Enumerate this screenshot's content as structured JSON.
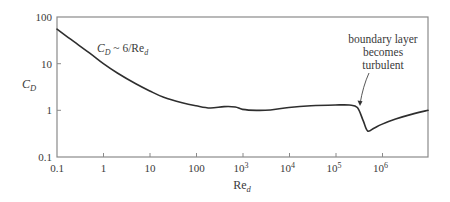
{
  "chart_data": {
    "type": "line",
    "title": "",
    "xlabel": "Re_d",
    "ylabel": "C_D",
    "xscale": "log",
    "yscale": "log",
    "xlim": [
      0.1,
      10000000
    ],
    "ylim": [
      0.1,
      100
    ],
    "grid": false,
    "legend": null,
    "x_tick_labels": [
      "0.1",
      "1",
      "10",
      "100",
      "10^3",
      "10^4",
      "10^5",
      "10^6"
    ],
    "x_tick_values": [
      0.1,
      1,
      10,
      100,
      1000,
      10000,
      100000,
      1000000
    ],
    "y_tick_labels": [
      "0.1",
      "1",
      "10",
      "100"
    ],
    "y_tick_values": [
      0.1,
      1,
      10,
      100
    ],
    "series": [
      {
        "name": "C_D vs Re_d (sphere drag)",
        "x": [
          0.1,
          0.2,
          0.5,
          1,
          2,
          5,
          10,
          20,
          50,
          100,
          200,
          400,
          700,
          1000,
          2000,
          4000,
          10000,
          30000,
          100000,
          200000,
          300000,
          400000,
          500000,
          700000,
          1000000,
          2000000,
          5000000,
          10000000
        ],
        "y": [
          55,
          33,
          17,
          10,
          6.3,
          3.7,
          2.6,
          1.9,
          1.45,
          1.25,
          1.12,
          1.2,
          1.18,
          1.05,
          1.0,
          1.02,
          1.15,
          1.25,
          1.3,
          1.3,
          1.15,
          0.6,
          0.36,
          0.42,
          0.5,
          0.65,
          0.85,
          1.0
        ]
      }
    ],
    "annotations": [
      {
        "text": "C_D ~ 6/Re_d",
        "near_x": 3,
        "near_y": 10
      },
      {
        "text": "boundary layer becomes turbulent",
        "arrow_to_x": 300000,
        "arrow_to_y": 1.2
      }
    ]
  },
  "labels": {
    "y_axis_title_main": "C",
    "y_axis_title_sub": "D",
    "x_axis_title_main": "Re",
    "x_axis_title_sub": "d",
    "formula_cd": "C",
    "formula_sub_d": "D",
    "formula_rest": " ~ 6/Re",
    "formula_sub_d2": "d",
    "annot_line1": "boundary layer",
    "annot_line2": "becomes",
    "annot_line3": "turbulent",
    "y_ticks": [
      "100",
      "10",
      "1",
      "0.1"
    ],
    "x_ticks": [
      "0.1",
      "1",
      "10",
      "100",
      "10",
      "10",
      "10",
      "10"
    ],
    "x_tick_exps": [
      "",
      "",
      "",
      "",
      "3",
      "4",
      "5",
      "6"
    ]
  }
}
